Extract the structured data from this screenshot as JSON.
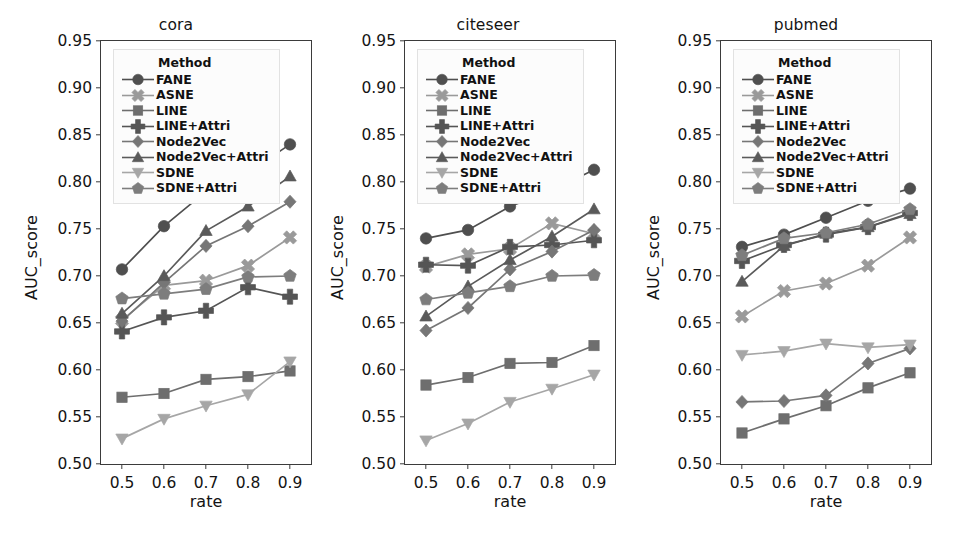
{
  "figure": {
    "panel_count": 3,
    "background": "#ffffff"
  },
  "axes": {
    "ylabel": "AUC_score",
    "xlabel": "rate",
    "yticks": [
      "0.50",
      "0.55",
      "0.60",
      "0.65",
      "0.70",
      "0.75",
      "0.80",
      "0.85",
      "0.90",
      "0.95"
    ],
    "ytick_values": [
      0.5,
      0.55,
      0.6,
      0.65,
      0.7,
      0.75,
      0.8,
      0.85,
      0.9,
      0.95
    ],
    "xticks": [
      "0.5",
      "0.6",
      "0.7",
      "0.8",
      "0.9"
    ],
    "xtick_values": [
      0.5,
      0.6,
      0.7,
      0.8,
      0.9
    ],
    "ylim": [
      0.5,
      0.95
    ],
    "xlim": [
      0.45,
      0.95
    ]
  },
  "legend": {
    "title": "Method",
    "position": "upper-left-inside",
    "entries": [
      {
        "label": "FANE",
        "marker": "circle",
        "color": "#4f4f4f"
      },
      {
        "label": "ASNE",
        "marker": "x",
        "color": "#9a9a9a"
      },
      {
        "label": "LINE",
        "marker": "square",
        "color": "#6e6e6e"
      },
      {
        "label": "LINE+Attri",
        "marker": "plus",
        "color": "#555555"
      },
      {
        "label": "Node2Vec",
        "marker": "diamond",
        "color": "#767676"
      },
      {
        "label": "Node2Vec+Attri",
        "marker": "triangle-up",
        "color": "#5a5a5a"
      },
      {
        "label": "SDNE",
        "marker": "triangle-down",
        "color": "#a6a6a6"
      },
      {
        "label": "SDNE+Attri",
        "marker": "pentagon",
        "color": "#7d7d7d"
      }
    ]
  },
  "chart_data": [
    {
      "type": "line",
      "title": "cora",
      "xlabel": "rate",
      "ylabel": "AUC_score",
      "x": [
        0.5,
        0.6,
        0.7,
        0.8,
        0.9
      ],
      "xlim": [
        0.45,
        0.95
      ],
      "ylim": [
        0.5,
        0.95
      ],
      "grid": false,
      "legend_position": "upper left",
      "series": [
        {
          "name": "FANE",
          "marker": "circle",
          "color": "#4f4f4f",
          "values": [
            0.707,
            0.753,
            0.79,
            0.81,
            0.84
          ]
        },
        {
          "name": "ASNE",
          "marker": "x",
          "color": "#9a9a9a",
          "values": [
            0.653,
            0.69,
            0.695,
            0.711,
            0.741
          ]
        },
        {
          "name": "LINE",
          "marker": "square",
          "color": "#6e6e6e",
          "values": [
            0.571,
            0.575,
            0.59,
            0.593,
            0.599
          ]
        },
        {
          "name": "LINE+Attri",
          "marker": "plus",
          "color": "#555555",
          "values": [
            0.641,
            0.656,
            0.663,
            0.688,
            0.678
          ]
        },
        {
          "name": "Node2Vec",
          "marker": "diamond",
          "color": "#767676",
          "values": [
            0.652,
            0.693,
            0.732,
            0.753,
            0.779
          ]
        },
        {
          "name": "Node2Vec+Attri",
          "marker": "triangle-up",
          "color": "#5a5a5a",
          "values": [
            0.66,
            0.7,
            0.748,
            0.774,
            0.806
          ]
        },
        {
          "name": "SDNE",
          "marker": "triangle-down",
          "color": "#a6a6a6",
          "values": [
            0.527,
            0.548,
            0.562,
            0.574,
            0.609
          ]
        },
        {
          "name": "SDNE+Attri",
          "marker": "pentagon",
          "color": "#7d7d7d",
          "values": [
            0.676,
            0.681,
            0.686,
            0.699,
            0.7
          ]
        }
      ]
    },
    {
      "type": "line",
      "title": "citeseer",
      "xlabel": "rate",
      "ylabel": "AUC_score",
      "x": [
        0.5,
        0.6,
        0.7,
        0.8,
        0.9
      ],
      "xlim": [
        0.45,
        0.95
      ],
      "ylim": [
        0.5,
        0.95
      ],
      "grid": false,
      "legend_position": "upper left",
      "series": [
        {
          "name": "FANE",
          "marker": "circle",
          "color": "#4f4f4f",
          "values": [
            0.74,
            0.749,
            0.774,
            0.791,
            0.813
          ]
        },
        {
          "name": "ASNE",
          "marker": "x",
          "color": "#9a9a9a",
          "values": [
            0.71,
            0.723,
            0.729,
            0.756,
            0.745
          ]
        },
        {
          "name": "LINE",
          "marker": "square",
          "color": "#6e6e6e",
          "values": [
            0.584,
            0.592,
            0.607,
            0.608,
            0.626
          ]
        },
        {
          "name": "LINE+Attri",
          "marker": "plus",
          "color": "#555555",
          "values": [
            0.712,
            0.711,
            0.731,
            0.733,
            0.738
          ]
        },
        {
          "name": "Node2Vec",
          "marker": "diamond",
          "color": "#767676",
          "values": [
            0.642,
            0.666,
            0.707,
            0.726,
            0.749
          ]
        },
        {
          "name": "Node2Vec+Attri",
          "marker": "triangle-up",
          "color": "#5a5a5a",
          "values": [
            0.657,
            0.689,
            0.717,
            0.742,
            0.771
          ]
        },
        {
          "name": "SDNE",
          "marker": "triangle-down",
          "color": "#a6a6a6",
          "values": [
            0.525,
            0.543,
            0.566,
            0.58,
            0.595
          ]
        },
        {
          "name": "SDNE+Attri",
          "marker": "pentagon",
          "color": "#7d7d7d",
          "values": [
            0.675,
            0.682,
            0.689,
            0.7,
            0.701
          ]
        }
      ]
    },
    {
      "type": "line",
      "title": "pubmed",
      "xlabel": "rate",
      "ylabel": "AUC_score",
      "x": [
        0.5,
        0.6,
        0.7,
        0.8,
        0.9
      ],
      "xlim": [
        0.45,
        0.95
      ],
      "ylim": [
        0.5,
        0.95
      ],
      "grid": false,
      "legend_position": "upper left",
      "series": [
        {
          "name": "FANE",
          "marker": "circle",
          "color": "#4f4f4f",
          "values": [
            0.731,
            0.744,
            0.762,
            0.78,
            0.793
          ]
        },
        {
          "name": "ASNE",
          "marker": "x",
          "color": "#9a9a9a",
          "values": [
            0.657,
            0.684,
            0.692,
            0.711,
            0.741
          ]
        },
        {
          "name": "LINE",
          "marker": "square",
          "color": "#6e6e6e",
          "values": [
            0.533,
            0.548,
            0.562,
            0.581,
            0.597
          ]
        },
        {
          "name": "LINE+Attri",
          "marker": "plus",
          "color": "#555555",
          "values": [
            0.716,
            0.733,
            0.744,
            0.752,
            0.767
          ]
        },
        {
          "name": "Node2Vec",
          "marker": "diamond",
          "color": "#767676",
          "values": [
            0.566,
            0.567,
            0.573,
            0.607,
            0.623
          ]
        },
        {
          "name": "Node2Vec+Attri",
          "marker": "triangle-up",
          "color": "#5a5a5a",
          "values": [
            0.694,
            0.732,
            0.745,
            0.752,
            0.766
          ]
        },
        {
          "name": "SDNE",
          "marker": "triangle-down",
          "color": "#a6a6a6",
          "values": [
            0.616,
            0.62,
            0.628,
            0.624,
            0.627
          ]
        },
        {
          "name": "SDNE+Attri",
          "marker": "pentagon",
          "color": "#7d7d7d",
          "values": [
            0.722,
            0.74,
            0.746,
            0.755,
            0.771
          ]
        }
      ]
    }
  ]
}
